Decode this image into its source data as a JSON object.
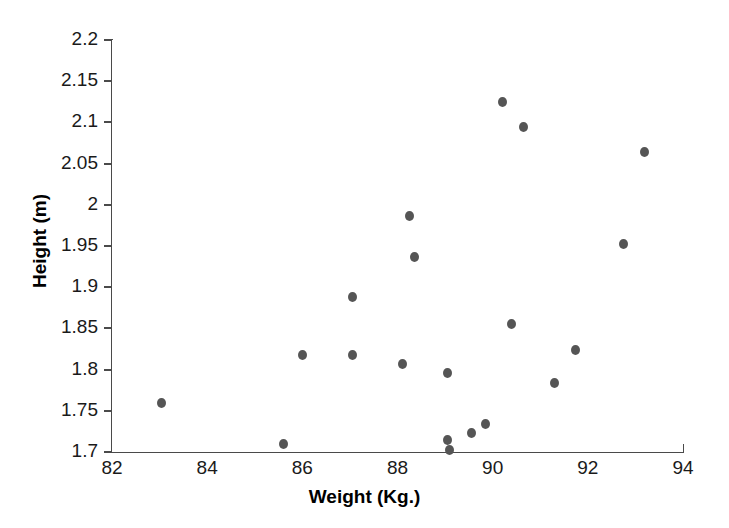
{
  "chart_data": {
    "type": "scatter",
    "title": "",
    "xlabel": "Weight (Kg.)",
    "ylabel": "Height (m)",
    "xlim": [
      82,
      94
    ],
    "ylim": [
      1.7,
      2.2
    ],
    "grid": false,
    "legend": null,
    "marker_color": "#555555",
    "axis_color": "#4a4a4a",
    "background_color": "#ffffff",
    "xticks": [
      82,
      84,
      86,
      88,
      90,
      92,
      94
    ],
    "xtick_labels": [
      "82",
      "84",
      "86",
      "88",
      "90",
      "92",
      "94"
    ],
    "xminor_ticks": [
      83,
      85,
      87,
      89,
      91,
      93
    ],
    "yticks": [
      1.7,
      1.75,
      1.8,
      1.85,
      1.9,
      1.95,
      2.0,
      2.05,
      2.1,
      2.15,
      2.2
    ],
    "ytick_labels": [
      "1.7",
      "1.75",
      "1.8",
      "1.85",
      "1.9",
      "1.95",
      "2",
      "2.05",
      "2.1",
      "2.15",
      "2.2"
    ],
    "points": [
      {
        "x": 83.05,
        "y": 1.759
      },
      {
        "x": 85.6,
        "y": 1.71
      },
      {
        "x": 86.0,
        "y": 1.818
      },
      {
        "x": 87.05,
        "y": 1.888
      },
      {
        "x": 87.05,
        "y": 1.818
      },
      {
        "x": 88.1,
        "y": 1.807
      },
      {
        "x": 88.25,
        "y": 1.987
      },
      {
        "x": 88.35,
        "y": 1.937
      },
      {
        "x": 89.05,
        "y": 1.796
      },
      {
        "x": 89.05,
        "y": 1.714
      },
      {
        "x": 89.1,
        "y": 1.703
      },
      {
        "x": 89.55,
        "y": 1.723
      },
      {
        "x": 89.85,
        "y": 1.734
      },
      {
        "x": 90.2,
        "y": 2.125
      },
      {
        "x": 90.4,
        "y": 1.855
      },
      {
        "x": 90.65,
        "y": 2.095
      },
      {
        "x": 91.3,
        "y": 1.784
      },
      {
        "x": 91.75,
        "y": 1.824
      },
      {
        "x": 92.75,
        "y": 1.953
      },
      {
        "x": 93.2,
        "y": 2.064
      }
    ]
  }
}
